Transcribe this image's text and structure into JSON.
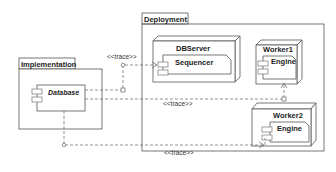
{
  "diagram": {
    "type": "uml-deployment",
    "packages": [
      {
        "id": "implementation",
        "label": "Implementation"
      },
      {
        "id": "deployment",
        "label": "Deployment"
      }
    ],
    "nodes": [
      {
        "id": "dbserver",
        "label": "DBServer",
        "component": "Sequencer"
      },
      {
        "id": "worker1",
        "label": "Worker1",
        "component": "Engine"
      },
      {
        "id": "worker2",
        "label": "Worker2",
        "component": "Engine"
      }
    ],
    "artifacts": [
      {
        "id": "database",
        "label": "Database",
        "package": "implementation"
      }
    ],
    "edges": [
      {
        "from": "database",
        "to": "dbserver.sequencer",
        "label": "<<trace>>"
      },
      {
        "from": "database",
        "to": "worker1.engine",
        "label": "<<trace>>"
      },
      {
        "from": "database",
        "to": "worker2.engine",
        "label": "<<trace>>"
      }
    ]
  },
  "labels": {
    "implementation": "Implementation",
    "deployment": "Deployment",
    "database": "Database",
    "dbserver": "DBServer",
    "sequencer": "Sequencer",
    "worker1": "Worker1",
    "worker1_engine": "Engine",
    "worker2": "Worker2",
    "worker2_engine": "Engine",
    "trace1": "<<trace>>",
    "trace2": "<<trace>>",
    "trace3": "<<trace>>"
  },
  "colors": {
    "line": "#555555",
    "text": "#222222",
    "background": "#ffffff"
  }
}
